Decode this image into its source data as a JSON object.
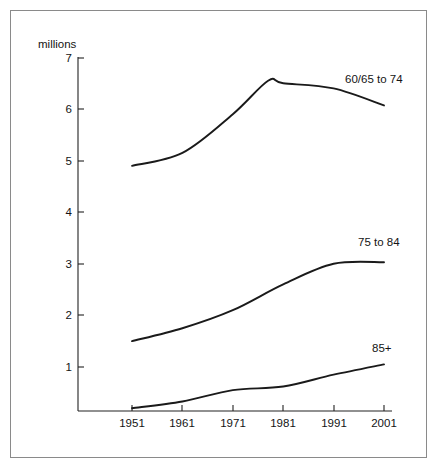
{
  "chart_data": {
    "type": "line",
    "title": "",
    "subtitle": "",
    "xlabel": "",
    "ylabel": "millions",
    "unit_label": "millions",
    "grid": false,
    "legend_position": "inline-right-of-curve",
    "x": [
      1951,
      1961,
      1971,
      1981,
      1991,
      2001
    ],
    "xtick_labels": [
      "1951",
      "1961",
      "1971",
      "1981",
      "1991",
      "2001"
    ],
    "ytick_labels": [
      "1",
      "2",
      "3",
      "4",
      "5",
      "6",
      "7"
    ],
    "ytick_values": [
      1,
      2,
      3,
      4,
      5,
      6,
      7
    ],
    "xlim": [
      1947,
      2003
    ],
    "ylim": [
      0,
      7
    ],
    "series": [
      {
        "name": "60/65 to 74",
        "label": "60/65  to  74",
        "values": [
          4.9,
          5.15,
          5.9,
          6.5,
          6.4,
          6.07
        ],
        "peak_value": 6.55,
        "peak_x": 1978,
        "color": "#1a1a1a"
      },
      {
        "name": "75 to 84",
        "label": "75  to  84",
        "values": [
          1.5,
          1.75,
          2.1,
          2.6,
          3.0,
          3.03
        ],
        "color": "#1a1a1a"
      },
      {
        "name": "85+",
        "label": "85+",
        "values": [
          0.2,
          0.33,
          0.55,
          0.62,
          0.85,
          1.05
        ],
        "color": "#1a1a1a"
      }
    ],
    "annotations": []
  },
  "axes": {
    "y_unit": "millions",
    "y_ticks": [
      {
        "label": "7"
      },
      {
        "label": "6"
      },
      {
        "label": "5"
      },
      {
        "label": "4"
      },
      {
        "label": "3"
      },
      {
        "label": "2"
      },
      {
        "label": "1"
      }
    ],
    "x_ticks": [
      {
        "label": "1951"
      },
      {
        "label": "1961"
      },
      {
        "label": "1971"
      },
      {
        "label": "1981"
      },
      {
        "label": "1991"
      },
      {
        "label": "2001"
      }
    ]
  },
  "series_labels": {
    "top": "60/65  to  74",
    "middle": "75  to  84",
    "bottom": "85+"
  },
  "style": {
    "curve_color": "#1a1a1a",
    "axis_color": "#222222",
    "frame_color": "#8a8a8a",
    "background": "#ffffff",
    "text_color": "#141414"
  }
}
